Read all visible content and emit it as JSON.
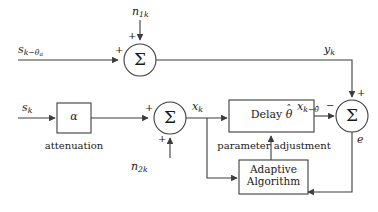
{
  "diagram": {
    "stroke_color": "#3d3d3d",
    "text_color": "#1a1a1a",
    "background": "#ffffff"
  },
  "signals": {
    "delayed_source": {
      "base": "s",
      "sub": "k−θ",
      "subsub": "a",
      "full": "s_{k−θa}"
    },
    "source": {
      "base": "s",
      "sub": "k",
      "full": "s_k"
    },
    "noise_1": {
      "base": "n",
      "sub": "1k",
      "full": "n_{1k}"
    },
    "noise_2": {
      "base": "n",
      "sub": "2k",
      "full": "n_{2k}"
    },
    "reference_output": {
      "base": "y",
      "sub": "k",
      "full": "y_k"
    },
    "mixed_signal": {
      "base": "x",
      "sub": "k",
      "full": "x_k"
    },
    "delayed_signal": {
      "base": "x",
      "sub": "k−θ̂",
      "full": "x_{k−θhat}"
    },
    "error": {
      "base": "e",
      "full": "e"
    }
  },
  "blocks": {
    "attenuator": {
      "symbol": "α",
      "caption": "attenuation"
    },
    "delay": {
      "label_text": "Delay",
      "param": "θ",
      "param_accent": "ˆ"
    },
    "adaptive": {
      "line1": "Adaptive",
      "line2": "Algorithm"
    }
  },
  "summers": {
    "top": {
      "symbol": "Σ",
      "input_left_sign": "+",
      "input_top_sign": "+"
    },
    "middle": {
      "symbol": "Σ",
      "input_left_sign": "+",
      "input_bottom_sign": "+"
    },
    "right": {
      "symbol": "Σ",
      "input_top_sign": "+",
      "input_left_sign": "−"
    }
  },
  "annotations": {
    "parameter_adjustment": "parameter adjustment"
  }
}
